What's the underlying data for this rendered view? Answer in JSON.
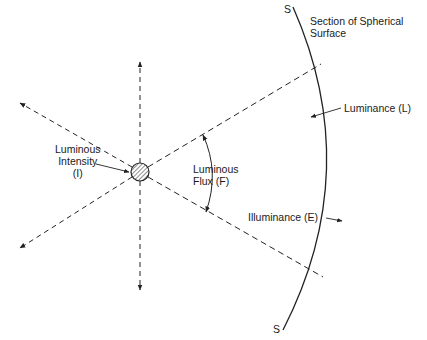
{
  "diagram": {
    "title_fragment": "",
    "labels": {
      "surface": [
        "Section of Spherical",
        "Surface"
      ],
      "s_top": "S",
      "s_bottom": "S",
      "luminance": "Luminance (L)",
      "intensity": [
        "Luminous",
        "Intensity",
        "(I)"
      ],
      "flux": [
        "Luminous",
        "Flux (F)"
      ],
      "illuminance": "Illuminance (E)"
    },
    "colors": {
      "line": "#222222",
      "background": "#ffffff"
    }
  }
}
